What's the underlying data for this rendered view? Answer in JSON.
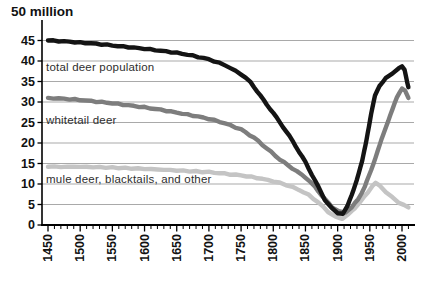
{
  "chart_data": {
    "type": "line",
    "title": "",
    "xlabel": "",
    "ylabel": "",
    "y_unit_label": "50 million",
    "y_ticks": [
      45,
      40,
      35,
      30,
      25,
      20,
      15,
      10,
      5,
      0
    ],
    "y_range": [
      0,
      50
    ],
    "x_major_ticks": [
      1450,
      1500,
      1550,
      1600,
      1650,
      1700,
      1750,
      1800,
      1850,
      1900,
      1950,
      2000
    ],
    "x_minor_tick_step": 10,
    "x_range": [
      1450,
      2010
    ],
    "grid": "horizontal",
    "legend_position": "in-plot-labels",
    "series": [
      {
        "id": "total-deer-population",
        "label": "total deer population",
        "color": "#141414",
        "points": [
          [
            1450,
            45
          ],
          [
            1475,
            44.8
          ],
          [
            1500,
            44.5
          ],
          [
            1525,
            44.2
          ],
          [
            1550,
            43.8
          ],
          [
            1575,
            43.4
          ],
          [
            1600,
            43
          ],
          [
            1625,
            42.5
          ],
          [
            1650,
            42
          ],
          [
            1675,
            41.3
          ],
          [
            1700,
            40.4
          ],
          [
            1725,
            39
          ],
          [
            1750,
            36.8
          ],
          [
            1765,
            34.8
          ],
          [
            1780,
            31.5
          ],
          [
            1800,
            27.3
          ],
          [
            1815,
            24
          ],
          [
            1830,
            20.5
          ],
          [
            1850,
            15.3
          ],
          [
            1860,
            12.3
          ],
          [
            1870,
            9.3
          ],
          [
            1880,
            6.2
          ],
          [
            1890,
            4.2
          ],
          [
            1900,
            3
          ],
          [
            1908,
            2.7
          ],
          [
            1915,
            4.5
          ],
          [
            1922,
            7.5
          ],
          [
            1930,
            11
          ],
          [
            1938,
            15.5
          ],
          [
            1945,
            21
          ],
          [
            1952,
            27
          ],
          [
            1958,
            31.5
          ],
          [
            1965,
            34
          ],
          [
            1975,
            35.8
          ],
          [
            1985,
            37
          ],
          [
            1995,
            38.2
          ],
          [
            2000,
            38.6
          ],
          [
            2004,
            37.8
          ],
          [
            2010,
            33.6
          ]
        ]
      },
      {
        "id": "whitetail-deer",
        "label": "whitetail deer",
        "color": "#7d7d7d",
        "points": [
          [
            1450,
            31
          ],
          [
            1475,
            30.8
          ],
          [
            1500,
            30.5
          ],
          [
            1525,
            30.1
          ],
          [
            1550,
            29.7
          ],
          [
            1575,
            29.2
          ],
          [
            1600,
            28.7
          ],
          [
            1625,
            28.1
          ],
          [
            1650,
            27.4
          ],
          [
            1675,
            26.7
          ],
          [
            1700,
            25.9
          ],
          [
            1725,
            24.8
          ],
          [
            1750,
            23.3
          ],
          [
            1770,
            21.3
          ],
          [
            1790,
            18.7
          ],
          [
            1810,
            16
          ],
          [
            1830,
            13.8
          ],
          [
            1850,
            11.6
          ],
          [
            1865,
            9.3
          ],
          [
            1880,
            6.3
          ],
          [
            1892,
            4.3
          ],
          [
            1902,
            3.3
          ],
          [
            1912,
            3.1
          ],
          [
            1922,
            4.3
          ],
          [
            1932,
            6.3
          ],
          [
            1942,
            9.3
          ],
          [
            1952,
            13.3
          ],
          [
            1962,
            18
          ],
          [
            1972,
            22.5
          ],
          [
            1982,
            27
          ],
          [
            1992,
            31
          ],
          [
            2000,
            33.4
          ],
          [
            2005,
            32.8
          ],
          [
            2010,
            31
          ]
        ]
      },
      {
        "id": "mule-deer-blacktails-and-other",
        "label": "mule deer, blacktails, and other",
        "color": "#c4c4c4",
        "points": [
          [
            1450,
            14.2
          ],
          [
            1500,
            14.2
          ],
          [
            1550,
            14
          ],
          [
            1600,
            13.7
          ],
          [
            1650,
            13.3
          ],
          [
            1700,
            12.9
          ],
          [
            1725,
            12.5
          ],
          [
            1750,
            12.1
          ],
          [
            1775,
            11.5
          ],
          [
            1800,
            10.7
          ],
          [
            1820,
            9.8
          ],
          [
            1840,
            8.6
          ],
          [
            1855,
            7.3
          ],
          [
            1870,
            5.5
          ],
          [
            1885,
            3.3
          ],
          [
            1897,
            1.9
          ],
          [
            1907,
            1.6
          ],
          [
            1917,
            2.6
          ],
          [
            1927,
            4.2
          ],
          [
            1937,
            6
          ],
          [
            1947,
            8
          ],
          [
            1954,
            9.6
          ],
          [
            1959,
            10.2
          ],
          [
            1966,
            9.5
          ],
          [
            1975,
            8.1
          ],
          [
            1985,
            6.7
          ],
          [
            1995,
            5.5
          ],
          [
            2003,
            4.8
          ],
          [
            2010,
            4.3
          ]
        ]
      }
    ]
  }
}
